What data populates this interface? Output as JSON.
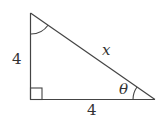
{
  "diagram": {
    "type": "right-triangle",
    "labels": {
      "vertical_leg": "4",
      "horizontal_leg": "4",
      "hypotenuse": "x",
      "angle": "θ"
    },
    "marks": {
      "right_angle": "bottom-left",
      "angle_arc_top": "top vertex",
      "angle_arc_theta": "bottom-right vertex"
    },
    "colors": {
      "stroke": "#444444",
      "text": "#333333",
      "background": "#ffffff"
    }
  }
}
